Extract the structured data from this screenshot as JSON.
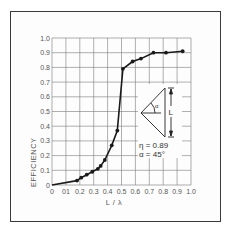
{
  "chart_data": {
    "type": "line",
    "title": "",
    "xlabel": "L / λ",
    "ylabel": "EFFICIENCY",
    "xlim": [
      0,
      1.0
    ],
    "ylim": [
      0,
      1.0
    ],
    "grid": true,
    "x_ticks": [
      "0",
      "0.1",
      "0.2",
      "0.3",
      "0.4",
      "0.5",
      "0.6",
      "0.7",
      "0.8",
      "0.9",
      "1.0"
    ],
    "y_ticks": [
      "0",
      "0.1",
      "0.2",
      "0.3",
      "0.4",
      "0.5",
      "0.6",
      "0.7",
      "0.8",
      "0.9",
      "1.0"
    ],
    "x_tick_labels": [
      "0",
      "01",
      "0.2",
      "0.3",
      "0.4",
      "0.5",
      "0.6",
      "0.7",
      "0.8",
      "0.9",
      "1.0"
    ],
    "y_tick_labels": [
      "0",
      "0.1",
      "0.2",
      "0.3",
      "0.4",
      "0.5",
      "0.6",
      "0.7",
      "0.8",
      "0.9",
      "1.0"
    ],
    "series": [
      {
        "name": "Efficiency",
        "curve_start": [
          0.0,
          0.0
        ],
        "x": [
          0.18,
          0.21,
          0.25,
          0.29,
          0.33,
          0.35,
          0.38,
          0.43,
          0.47,
          0.51,
          0.58,
          0.64,
          0.73,
          0.82,
          0.94
        ],
        "y": [
          0.03,
          0.05,
          0.07,
          0.09,
          0.11,
          0.13,
          0.17,
          0.27,
          0.37,
          0.79,
          0.84,
          0.86,
          0.9,
          0.9,
          0.91
        ]
      }
    ],
    "annotations": [
      {
        "text": "η = 0.89",
        "position": "inset below diagram"
      },
      {
        "text": "α = 45°",
        "position": "inset below diagram"
      },
      {
        "text": "L",
        "position": "inset dimension label"
      },
      {
        "text": "α",
        "position": "inset angle label"
      }
    ],
    "legend": null
  },
  "inset": {
    "dimension_label": "L",
    "angle_label": "α",
    "eta_text": "η = 0.89",
    "alpha_text": "α = 45°"
  },
  "axes": {
    "xlabel": "L / λ",
    "ylabel": "EFFICIENCY"
  },
  "colors": {
    "line": "#1a1a1a",
    "grid": "#7a7a7a",
    "frame": "#3a3a3a",
    "text": "#555555"
  }
}
